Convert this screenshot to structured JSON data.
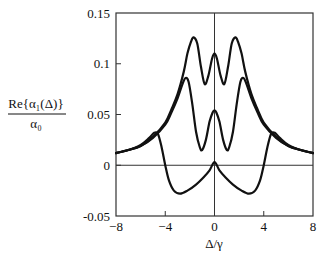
{
  "chart_data": {
    "type": "line",
    "title": "",
    "xlabel": "Δ/γ",
    "ylabel_numerator": "Re{α₁(Δ)}",
    "ylabel_denominator": "α₀",
    "xlim": [
      -8,
      8
    ],
    "ylim": [
      -0.05,
      0.15
    ],
    "x_ticks": [
      -8,
      -4,
      0,
      4,
      8
    ],
    "x_tick_labels": [
      "−8",
      "−4",
      "0",
      "4",
      "8"
    ],
    "y_ticks": [
      -0.05,
      0,
      0.05,
      0.1,
      0.15
    ],
    "y_tick_labels": [
      "-0.05",
      "0",
      "0.05",
      "0.1",
      "0.15"
    ],
    "grid": false,
    "reference_lines": {
      "x": 0,
      "y": 0
    },
    "legend": "none",
    "series": [
      {
        "name": "curve-top",
        "x": [
          -8,
          -7,
          -6,
          -5,
          -4,
          -3.5,
          -3,
          -2.5,
          -2.2,
          -1.9,
          -1.7,
          -1.4,
          -1.1,
          -0.8,
          -0.5,
          -0.2,
          0,
          0.2,
          0.5,
          0.8,
          1.1,
          1.4,
          1.7,
          1.9,
          2.2,
          2.5,
          3,
          3.5,
          4,
          5,
          6,
          7,
          8
        ],
        "y": [
          0.012,
          0.015,
          0.019,
          0.028,
          0.042,
          0.055,
          0.07,
          0.092,
          0.11,
          0.122,
          0.126,
          0.12,
          0.097,
          0.08,
          0.088,
          0.105,
          0.11,
          0.105,
          0.088,
          0.08,
          0.097,
          0.12,
          0.126,
          0.122,
          0.11,
          0.092,
          0.07,
          0.055,
          0.042,
          0.028,
          0.019,
          0.015,
          0.012
        ]
      },
      {
        "name": "curve-middle",
        "x": [
          -8,
          -7,
          -6,
          -5,
          -4,
          -3.5,
          -3,
          -2.6,
          -2.35,
          -2.1,
          -1.8,
          -1.5,
          -1.2,
          -1.0,
          -0.7,
          -0.4,
          -0.15,
          0,
          0.15,
          0.4,
          0.7,
          1.0,
          1.2,
          1.5,
          1.8,
          2.1,
          2.35,
          2.6,
          3,
          3.5,
          4,
          5,
          6,
          7,
          8
        ],
        "y": [
          0.012,
          0.015,
          0.019,
          0.027,
          0.04,
          0.052,
          0.066,
          0.08,
          0.086,
          0.082,
          0.06,
          0.033,
          0.018,
          0.015,
          0.025,
          0.043,
          0.052,
          0.054,
          0.052,
          0.043,
          0.025,
          0.015,
          0.018,
          0.033,
          0.06,
          0.082,
          0.086,
          0.08,
          0.066,
          0.052,
          0.04,
          0.027,
          0.019,
          0.015,
          0.012
        ]
      },
      {
        "name": "curve-bottom",
        "x": [
          -8,
          -7,
          -6,
          -5.3,
          -4.9,
          -4.6,
          -4.3,
          -4,
          -3.7,
          -3.3,
          -2.8,
          -2.2,
          -1.5,
          -0.9,
          -0.4,
          0,
          0.4,
          0.9,
          1.5,
          2.2,
          2.8,
          3.3,
          3.7,
          4,
          4.3,
          4.6,
          4.9,
          5.3,
          6,
          7,
          8
        ],
        "y": [
          0.012,
          0.015,
          0.02,
          0.027,
          0.032,
          0.031,
          0.018,
          0.0,
          -0.015,
          -0.025,
          -0.028,
          -0.025,
          -0.019,
          -0.012,
          -0.005,
          0.003,
          -0.005,
          -0.012,
          -0.019,
          -0.025,
          -0.028,
          -0.025,
          -0.015,
          0.0,
          0.018,
          0.031,
          0.032,
          0.027,
          0.02,
          0.015,
          0.012
        ]
      }
    ]
  }
}
